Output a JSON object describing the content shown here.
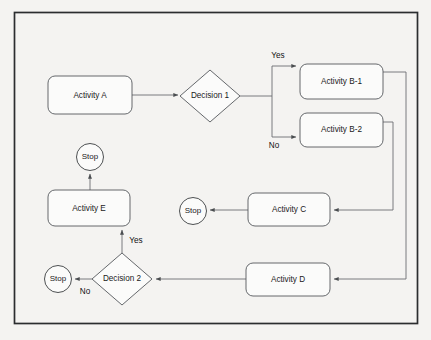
{
  "diagram": {
    "type": "flowchart",
    "colors": {
      "background": "#f4f3f1",
      "frame_border": "#2b2d2f",
      "shape_fill": "#fbfbfa",
      "shape_stroke": "#55585c",
      "edge_stroke": "#6b6e72",
      "text": "#1a1a1a"
    },
    "nodes": [
      {
        "id": "activity_a",
        "label": "Activity A",
        "shape": "rounded-rectangle",
        "x": 48,
        "y": 76,
        "w": 84,
        "h": 38
      },
      {
        "id": "decision_1",
        "label": "Decision 1",
        "shape": "diamond",
        "cx": 210,
        "cy": 96,
        "rx": 30,
        "ry": 26
      },
      {
        "id": "activity_b1",
        "label": "Activity B-1",
        "shape": "rounded-rectangle",
        "x": 300,
        "y": 64,
        "w": 83,
        "h": 35
      },
      {
        "id": "activity_b2",
        "label": "Activity B-2",
        "shape": "rounded-rectangle",
        "x": 300,
        "y": 113,
        "w": 83,
        "h": 34
      },
      {
        "id": "activity_c",
        "label": "Activity C",
        "shape": "rounded-rectangle",
        "x": 248,
        "y": 193,
        "w": 82,
        "h": 33
      },
      {
        "id": "activity_d",
        "label": "Activity D",
        "shape": "rounded-rectangle",
        "x": 246,
        "y": 263,
        "w": 84,
        "h": 33
      },
      {
        "id": "activity_e",
        "label": "Activity E",
        "shape": "rounded-rectangle",
        "x": 48,
        "y": 190,
        "w": 82,
        "h": 36
      },
      {
        "id": "decision_2",
        "label": "Decision 2",
        "shape": "diamond",
        "cx": 122,
        "cy": 279,
        "rx": 30,
        "ry": 26
      },
      {
        "id": "stop_top",
        "label": "Stop",
        "shape": "circle",
        "cx": 90,
        "cy": 157,
        "r": 13.5
      },
      {
        "id": "stop_middle",
        "label": "Stop",
        "shape": "circle",
        "cx": 193,
        "cy": 211,
        "r": 13.5
      },
      {
        "id": "stop_bottom",
        "label": "Stop",
        "shape": "circle",
        "cx": 58,
        "cy": 279,
        "r": 13.5
      }
    ],
    "edge_labels": [
      {
        "id": "yes_decision_1",
        "text": "Yes",
        "x": 278,
        "y": 56
      },
      {
        "id": "no_decision_1",
        "text": "No",
        "x": 274,
        "y": 146
      },
      {
        "id": "yes_decision_2",
        "text": "Yes",
        "x": 136,
        "y": 241
      },
      {
        "id": "no_decision_2",
        "text": "No",
        "x": 85,
        "y": 292
      }
    ],
    "edges": [
      {
        "id": "a-to-d1",
        "from": "activity_a",
        "to": "decision_1",
        "label": ""
      },
      {
        "id": "d1-to-b1",
        "from": "decision_1",
        "to": "activity_b1",
        "label": "Yes"
      },
      {
        "id": "d1-to-b2",
        "from": "decision_1",
        "to": "activity_b2",
        "label": "No"
      },
      {
        "id": "b1-to-d",
        "from": "activity_b1",
        "to": "activity_d",
        "label": ""
      },
      {
        "id": "b2-to-c",
        "from": "activity_b2",
        "to": "activity_c",
        "label": ""
      },
      {
        "id": "c-to-stop",
        "from": "activity_c",
        "to": "stop_middle",
        "label": ""
      },
      {
        "id": "d-to-d2",
        "from": "activity_d",
        "to": "decision_2",
        "label": ""
      },
      {
        "id": "d2-to-e",
        "from": "decision_2",
        "to": "activity_e",
        "label": "Yes"
      },
      {
        "id": "d2-to-stop",
        "from": "decision_2",
        "to": "stop_bottom",
        "label": "No"
      },
      {
        "id": "e-to-stop",
        "from": "activity_e",
        "to": "stop_top",
        "label": ""
      }
    ]
  }
}
